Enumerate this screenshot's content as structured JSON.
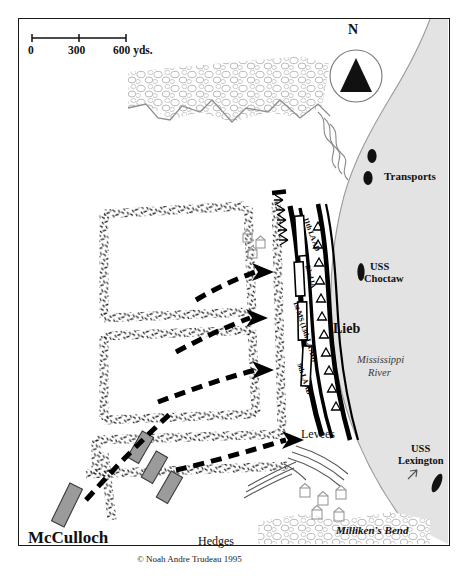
{
  "map": {
    "title_figures": {
      "mcculloch": "McCulloch",
      "lieb": "Lieb"
    },
    "scale_bar": {
      "tick_0": "0",
      "tick_300": "300",
      "tick_600": "600 yds."
    },
    "compass": {
      "north_label": "N",
      "icon": "north-arrow-triangle-icon"
    },
    "water": {
      "river_name_line1": "Mississippi",
      "river_name_line2": "River"
    },
    "vessels": [
      {
        "name": "Transports",
        "kind": "transport-ships"
      },
      {
        "name_line1": "USS",
        "name_line2": "Choctaw",
        "kind": "gunboat"
      },
      {
        "name_line1": "USS",
        "name_line2": "Lexington",
        "kind": "gunboat"
      }
    ],
    "place_labels": [
      {
        "text": "Levees"
      },
      {
        "text": "Hedges"
      },
      {
        "text": "Milliken's Bend"
      }
    ],
    "union_units": [
      {
        "label": "11th LA AD"
      },
      {
        "label": "23rd IA"
      },
      {
        "label": "1st MS (13th LA AD)"
      },
      {
        "label": "9th LA AD"
      }
    ],
    "credit": "© Noah Andre Trudeau 1995",
    "colors": {
      "ink": "#111111",
      "water": "#e2e2e2",
      "woods": "#b9b9b9",
      "confederate_block": "#9b9b9b",
      "arrow": "#000000"
    }
  }
}
